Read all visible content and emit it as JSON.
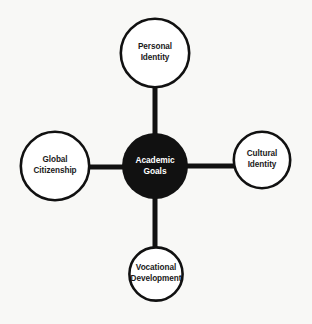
{
  "diagram": {
    "type": "hub-and-spoke",
    "background_color": "#f8f8f6",
    "hub": {
      "label": "Academic\nGoals",
      "text_line_1": "Academic",
      "text_line_2": "Goals",
      "fill_color": "#111111",
      "text_color": "#ffffff",
      "cx": 155,
      "cy": 166,
      "r": 33
    },
    "connector": {
      "color": "#111111",
      "width": 5
    },
    "nodes": [
      {
        "id": "personal-identity",
        "label": "Personal\nIdentity",
        "text_line_1": "Personal",
        "text_line_2": "Identity",
        "position": "top",
        "cx": 155,
        "cy": 53,
        "r": 35,
        "fill_color": "#ffffff",
        "stroke_color": "#111111",
        "text_color": "#1a1a1a"
      },
      {
        "id": "cultural-identity",
        "label": "Cultural\nIdentity",
        "text_line_1": "Cultural",
        "text_line_2": "Identity",
        "position": "right",
        "cx": 262,
        "cy": 160,
        "r": 29,
        "fill_color": "#ffffff",
        "stroke_color": "#111111",
        "text_color": "#1a1a1a"
      },
      {
        "id": "vocational-development",
        "label": "Vocational\nDevelopment",
        "text_line_1": "Vocational",
        "text_line_2": "Development",
        "position": "bottom",
        "cx": 156,
        "cy": 274,
        "r": 27,
        "fill_color": "#ffffff",
        "stroke_color": "#111111",
        "text_color": "#1a1a1a"
      },
      {
        "id": "global-citizenship",
        "label": "Global\nCitizenship",
        "text_line_1": "Global",
        "text_line_2": "Citizenship",
        "position": "left",
        "cx": 55,
        "cy": 166,
        "r": 35,
        "fill_color": "#ffffff",
        "stroke_color": "#111111",
        "text_color": "#1a1a1a"
      }
    ]
  }
}
